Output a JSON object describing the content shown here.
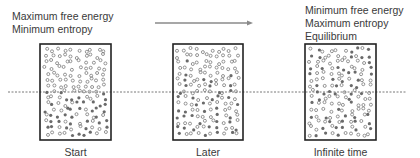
{
  "diagram": {
    "caption_left": [
      "Maximum free energy",
      "Minimum entropy"
    ],
    "caption_right": [
      "Minimum free energy",
      "Maximum entropy",
      "Equilibrium"
    ],
    "arrow": {
      "direction": "right",
      "x1": 155,
      "x2": 253,
      "y": 23
    },
    "baseline": {
      "style": "dashed",
      "y": 92,
      "x1": 8,
      "x2": 406
    },
    "boxes": [
      {
        "label": "Start",
        "x": 40,
        "y": 44,
        "w": 71,
        "h": 96,
        "mixing": 0.0
      },
      {
        "label": "Later",
        "x": 173,
        "y": 44,
        "w": 70,
        "h": 96,
        "mixing": 0.5
      },
      {
        "label": "Infinite time",
        "x": 305,
        "y": 44,
        "w": 71,
        "h": 96,
        "mixing": 1.0
      }
    ],
    "particles": {
      "open_circle": "low-energy/ordered molecule",
      "filled_circle": "mixed molecule",
      "per_box": 150
    },
    "colors": {
      "box_border": "#222222",
      "dot_open": "#7a7a7a",
      "dot_filled": "#6a6a6a",
      "arrow": "#8a8a8a",
      "baseline": "#555555",
      "text": "#3a3a3a"
    }
  }
}
